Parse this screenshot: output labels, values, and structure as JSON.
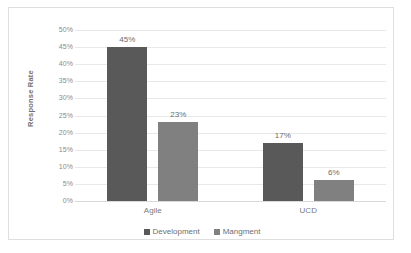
{
  "chart_data": {
    "type": "bar",
    "title": "",
    "xlabel": "",
    "ylabel": "Response Rate",
    "categories": [
      "Agile",
      "UCD"
    ],
    "series": [
      {
        "name": "Development",
        "values": [
          45,
          17
        ],
        "color": "#595959"
      },
      {
        "name": "Mangment",
        "values": [
          23,
          6
        ],
        "color": "#808080"
      }
    ],
    "value_labels": [
      "45%",
      "17%",
      "23%",
      "6%"
    ],
    "ylim": [
      0,
      50
    ],
    "ytick_labels": [
      "50%",
      "45%",
      "40%",
      "35%",
      "30%",
      "25%",
      "20%",
      "15%",
      "10%",
      "5%",
      "0%"
    ],
    "ytick_values": [
      50,
      45,
      40,
      35,
      30,
      25,
      20,
      15,
      10,
      5,
      0
    ],
    "grid": true,
    "legend_position": "bottom",
    "value_suffix": "%"
  },
  "axis": {
    "y_title": "Response Rate"
  },
  "legend": {
    "items": [
      {
        "label": "Development",
        "color": "#595959"
      },
      {
        "label": "Mangment",
        "color": "#808080"
      }
    ]
  },
  "colors": {
    "series_development": "#595959",
    "series_mangment": "#808080",
    "gridline": "#e8e8e8",
    "border": "#dfdfdf",
    "tick_text": "#8a8a8a",
    "background": "#ffffff"
  }
}
